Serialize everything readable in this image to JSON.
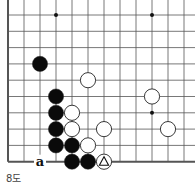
{
  "diagram": {
    "caption": "8도",
    "grid": {
      "cols": 12,
      "rows": 10,
      "x0": 8,
      "y0": 15,
      "dx": 16,
      "dy": 16.3,
      "left_edge": true,
      "bottom_edge": true
    },
    "star_points": [
      [
        3,
        0
      ],
      [
        9,
        0
      ],
      [
        9,
        6
      ]
    ],
    "stones": [
      {
        "color": "black",
        "col": 2,
        "row": 3
      },
      {
        "color": "white",
        "col": 5,
        "row": 4
      },
      {
        "color": "black",
        "col": 3,
        "row": 5
      },
      {
        "color": "white",
        "col": 9,
        "row": 5
      },
      {
        "color": "black",
        "col": 3,
        "row": 6
      },
      {
        "color": "white",
        "col": 4,
        "row": 6
      },
      {
        "color": "black",
        "col": 3,
        "row": 7
      },
      {
        "color": "white",
        "col": 4,
        "row": 7
      },
      {
        "color": "white",
        "col": 6,
        "row": 7
      },
      {
        "color": "white",
        "col": 10,
        "row": 7
      },
      {
        "color": "black",
        "col": 3,
        "row": 8
      },
      {
        "color": "black",
        "col": 4,
        "row": 8
      },
      {
        "color": "white",
        "col": 5,
        "row": 8
      },
      {
        "color": "black",
        "col": 4,
        "row": 9
      },
      {
        "color": "black",
        "col": 5,
        "row": 9
      },
      {
        "color": "white",
        "col": 6,
        "row": 9,
        "mark": "triangle"
      }
    ],
    "labels": [
      {
        "text": "a",
        "col": 2,
        "row": 9
      }
    ]
  }
}
